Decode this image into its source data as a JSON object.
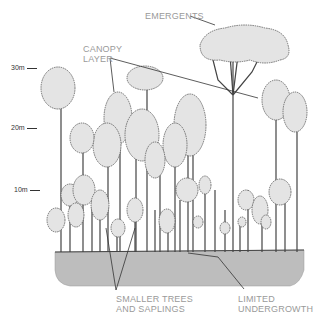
{
  "diagram": {
    "type": "rainforest-stratification",
    "colors": {
      "label": "#9a9a9a",
      "crown_fill": "#e4e4e4",
      "crown_stroke": "#555555",
      "ground_fill": "#bdbdbd",
      "trunk": "#444444",
      "leader": "#333333"
    },
    "scale": {
      "ticks": [
        {
          "label": "30m",
          "y": 68
        },
        {
          "label": "20m",
          "y": 128
        },
        {
          "label": "10m",
          "y": 190
        }
      ]
    },
    "labels": {
      "emergents": "EMERGENTS",
      "canopy_line1": "CANOPY",
      "canopy_line2": "LAYER",
      "smaller_line1": "SMALLER TREES",
      "smaller_line2": "AND SAPLINGS",
      "undergrowth_line1": "LIMITED",
      "undergrowth_line2": "UNDERGROWTH"
    },
    "layers": [
      "Emergents",
      "Canopy layer",
      "Smaller trees and saplings",
      "Limited undergrowth"
    ]
  }
}
